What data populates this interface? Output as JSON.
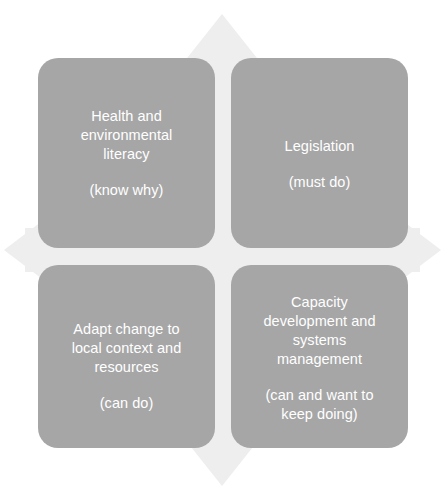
{
  "diagram": {
    "type": "2x2-quadrant-matrix",
    "background_shape": "four-direction-arrow-cross",
    "colors": {
      "card_fill": "#a6a6a6",
      "card_text": "#ffffff",
      "background": "#ffffff",
      "arrow_fill": "#eeeeee"
    },
    "quadrants": [
      {
        "id": "top-left",
        "title": "Health and\nenvironmental\nliteracy",
        "subtitle": "(know why)"
      },
      {
        "id": "top-right",
        "title": "Legislation",
        "subtitle": "(must do)"
      },
      {
        "id": "bottom-left",
        "title": "Adapt change to\nlocal context and\nresources",
        "subtitle": "(can do)"
      },
      {
        "id": "bottom-right",
        "title": "Capacity\ndevelopment and\nsystems\nmanagement",
        "subtitle": "(can and want to\nkeep doing)"
      }
    ]
  }
}
